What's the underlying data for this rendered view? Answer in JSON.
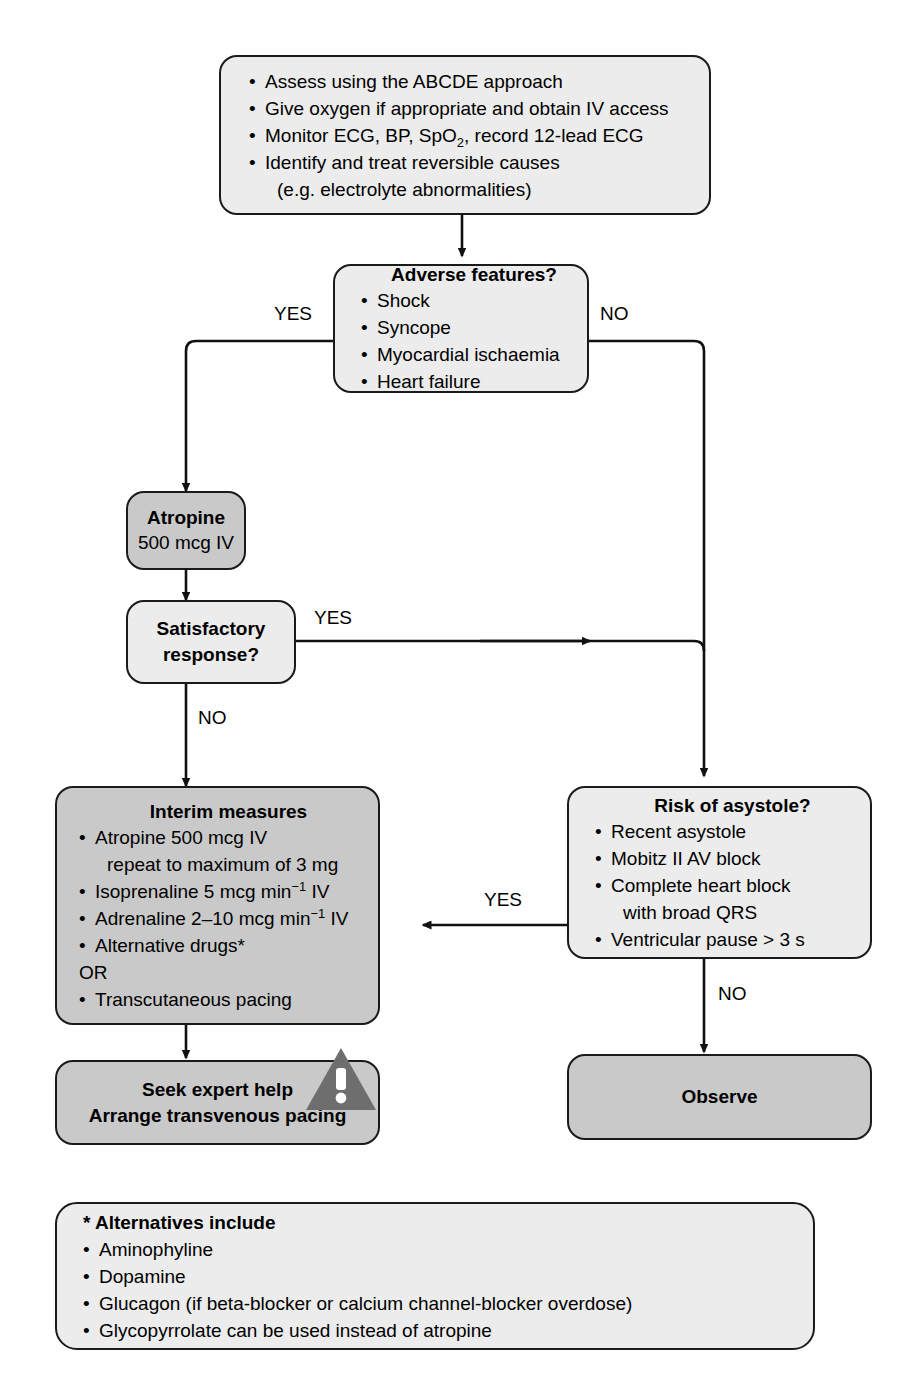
{
  "diagram": {
    "colors": {
      "box_light": "#ececec",
      "box_mid": "#e7e7e7",
      "box_dark": "#c9c9c9",
      "outline": "#1a1a1a",
      "warning_triangle": "#6e6e6e",
      "warning_mark": "#ffffff"
    }
  },
  "initial_assessment": {
    "items": [
      "Assess using the ABCDE approach",
      "Give oxygen if appropriate and obtain IV access",
      "Monitor ECG, BP, SpO2, record 12-lead ECG",
      "Identify and treat reversible causes",
      "(e.g. electrolyte abnormalities)"
    ],
    "item_monitor_pre": "Monitor ECG, BP, SpO",
    "item_monitor_sub": "2",
    "item_monitor_post": ", record 12-lead ECG"
  },
  "adverse_features": {
    "title": "Adverse features?",
    "items": [
      "Shock",
      "Syncope",
      "Myocardial ischaemia",
      "Heart failure"
    ]
  },
  "atropine": {
    "title": "Atropine",
    "dose": "500 mcg IV"
  },
  "satisfactory_response": {
    "line1": "Satisfactory",
    "line2": "response?"
  },
  "interim_measures": {
    "title": "Interim measures",
    "items": [
      "Atropine 500 mcg IV",
      "repeat to maximum of 3 mg",
      "Isoprenaline 5 mcg min-1 IV",
      "Adrenaline 2–10 mcg min-1 IV",
      "Alternative drugs*",
      "OR",
      "Transcutaneous pacing"
    ],
    "isoprenaline_pre": "Isoprenaline 5 mcg min",
    "isoprenaline_sup": "−1",
    "isoprenaline_post": " IV",
    "adrenaline_pre": "Adrenaline 2–10 mcg min",
    "adrenaline_sup": "−1",
    "adrenaline_post": " IV",
    "or_label": "OR"
  },
  "risk_of_asystole": {
    "title": "Risk of asystole?",
    "items": [
      "Recent asystole",
      "Mobitz II AV block",
      "Complete heart block",
      "with broad QRS",
      "Ventricular pause > 3 s"
    ]
  },
  "seek_expert_help": {
    "line1": "Seek expert help",
    "line2": "Arrange transvenous pacing",
    "icon": "warning-triangle-icon"
  },
  "observe": {
    "label": "Observe"
  },
  "footnote": {
    "title": "* Alternatives include",
    "items": [
      "Aminophyline",
      "Dopamine",
      "Glucagon (if beta-blocker or calcium channel-blocker overdose)",
      "Glycopyrrolate can be used instead of atropine"
    ]
  },
  "edge_labels": {
    "adverse_yes": "YES",
    "adverse_no": "NO",
    "satisfactory_yes": "YES",
    "satisfactory_no": "NO",
    "asystole_yes": "YES",
    "asystole_no": "NO"
  }
}
